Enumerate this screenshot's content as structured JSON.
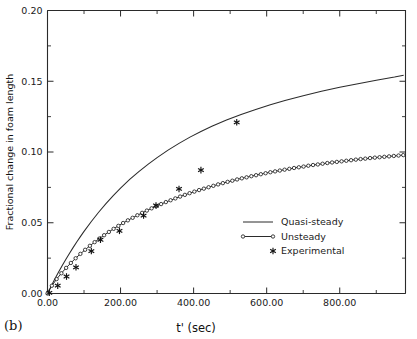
{
  "figure": {
    "panel_label": "(b)",
    "background_color": "#ffffff",
    "ink_color": "#1a1a1a"
  },
  "chart_data": {
    "type": "line",
    "title": "",
    "subtitle": "",
    "xlabel": "t' (sec)",
    "ylabel": "Fractional change in foam length",
    "xlim": [
      0,
      980
    ],
    "ylim": [
      0.0,
      0.2
    ],
    "grid": false,
    "legend_position": "center-right",
    "x_major_ticks": [
      0,
      200,
      400,
      600,
      800
    ],
    "x_major_tick_labels": [
      "0.00",
      "200.00",
      "400.00",
      "600.00",
      "800.00"
    ],
    "x_minor_tick_step": 100,
    "y_major_ticks": [
      0.0,
      0.05,
      0.1,
      0.15,
      0.2
    ],
    "y_major_tick_labels": [
      "0.00",
      "0.05",
      "0.10",
      "0.15",
      "0.20"
    ],
    "y_minor_tick_step": 0.025,
    "series": [
      {
        "name": "Quasi-steady",
        "style": "line",
        "marker": "none",
        "color": "#2b2b2b",
        "x": [
          0,
          10,
          20,
          30,
          40,
          50,
          60,
          70,
          80,
          90,
          100,
          120,
          140,
          160,
          180,
          200,
          225,
          250,
          275,
          300,
          330,
          360,
          390,
          420,
          450,
          490,
          530,
          570,
          610,
          650,
          700,
          750,
          800,
          850,
          900,
          950,
          975
        ],
        "y": [
          0.0,
          0.0052,
          0.0102,
          0.015,
          0.0196,
          0.024,
          0.0283,
          0.0324,
          0.0364,
          0.0402,
          0.0439,
          0.0509,
          0.0574,
          0.0635,
          0.0692,
          0.0745,
          0.0806,
          0.0862,
          0.0913,
          0.096,
          0.1013,
          0.1061,
          0.1105,
          0.1145,
          0.1182,
          0.1226,
          0.1265,
          0.1301,
          0.1334,
          0.1364,
          0.1398,
          0.1429,
          0.1457,
          0.1483,
          0.1507,
          0.153,
          0.1543
        ]
      },
      {
        "name": "Unsteady",
        "style": "line+marker",
        "marker": "circle",
        "color": "#2b2b2b",
        "x": [
          0,
          12,
          25,
          38,
          51,
          64,
          77,
          90,
          103,
          116,
          129,
          142,
          155,
          168,
          181,
          194,
          207,
          220,
          233,
          246,
          259,
          272,
          285,
          298,
          311,
          324,
          337,
          350,
          363,
          376,
          389,
          402,
          415,
          428,
          441,
          454,
          467,
          480,
          493,
          506,
          519,
          532,
          545,
          558,
          571,
          584,
          597,
          610,
          623,
          636,
          649,
          662,
          675,
          688,
          701,
          714,
          727,
          740,
          753,
          766,
          779,
          792,
          805,
          818,
          831,
          844,
          857,
          870,
          883,
          896,
          909,
          922,
          935,
          948,
          961,
          974
        ],
        "y": [
          0.0,
          0.0055,
          0.0102,
          0.0143,
          0.0181,
          0.0216,
          0.0249,
          0.028,
          0.0309,
          0.0337,
          0.0363,
          0.0388,
          0.0412,
          0.0435,
          0.0457,
          0.0478,
          0.0498,
          0.0517,
          0.0535,
          0.0553,
          0.057,
          0.0586,
          0.0602,
          0.0617,
          0.0632,
          0.0646,
          0.0659,
          0.0672,
          0.0685,
          0.0697,
          0.0709,
          0.072,
          0.0731,
          0.0741,
          0.0751,
          0.0761,
          0.0771,
          0.078,
          0.0789,
          0.0797,
          0.0806,
          0.0814,
          0.0821,
          0.0829,
          0.0836,
          0.0843,
          0.085,
          0.0857,
          0.0863,
          0.0869,
          0.0875,
          0.0881,
          0.0887,
          0.0892,
          0.0897,
          0.0903,
          0.0908,
          0.0912,
          0.0917,
          0.0922,
          0.0926,
          0.093,
          0.0934,
          0.0938,
          0.0942,
          0.0946,
          0.095,
          0.0953,
          0.0957,
          0.096,
          0.0963,
          0.0966,
          0.0969,
          0.0972,
          0.0975,
          0.0978
        ]
      },
      {
        "name": "Experimental",
        "style": "marker",
        "marker": "asterisk",
        "color": "#111111",
        "x": [
          5,
          28,
          52,
          78,
          120,
          145,
          197,
          263,
          297,
          360,
          420,
          518
        ],
        "y": [
          0.0005,
          0.0055,
          0.012,
          0.0185,
          0.03,
          0.038,
          0.0443,
          0.0551,
          0.0622,
          0.0739,
          0.0872,
          0.121
        ]
      }
    ],
    "legend_entries": [
      {
        "label": "Quasi-steady",
        "marker": "line"
      },
      {
        "label": "Unsteady",
        "marker": "line-circle"
      },
      {
        "label": "Experimental",
        "marker": "asterisk"
      }
    ]
  }
}
